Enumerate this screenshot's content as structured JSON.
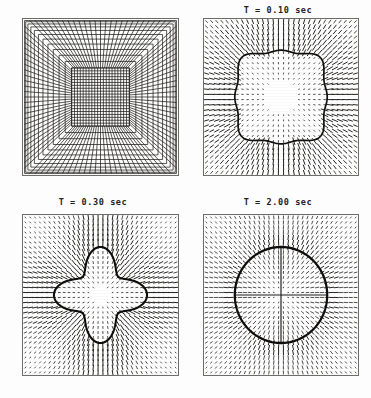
{
  "figure": {
    "title": "",
    "background_color": "#fdfdfd",
    "frame_color": "#6e6c68",
    "ink_color": "#1a1a1a",
    "panel_count": 4
  },
  "panels": [
    {
      "id": "panel-mesh-initial",
      "title": "",
      "kind": "mesh",
      "description": "undeformed graded square finite-element mesh"
    },
    {
      "id": "panel-t-010",
      "title": "T = 0.10 sec",
      "kind": "vector-field",
      "shape": "rounded-square-blob",
      "description": "deformed interface with outward radial velocity vectors"
    },
    {
      "id": "panel-t-030",
      "title": "T = 0.30 sec",
      "kind": "vector-field",
      "shape": "astroid-star",
      "description": "four-cusped concave star interface with radial velocity vectors"
    },
    {
      "id": "panel-t-200",
      "title": "T = 2.00 sec",
      "kind": "vector-field",
      "shape": "circle",
      "description": "relaxed circular interface with radial velocity vectors"
    }
  ],
  "chart_data": {
    "type": "scatter",
    "title": "",
    "xlabel": "",
    "ylabel": "",
    "grid": false,
    "legend": null,
    "subplots": [
      {
        "name": "panel-mesh-initial",
        "type": "mesh",
        "title": "",
        "row": 0,
        "col": 0,
        "xlim": [
          -1,
          1
        ],
        "ylim": [
          -1,
          1
        ],
        "mesh": {
          "style": "graded concentric square rings with radial corner lines",
          "ring_count": 11,
          "divisions_per_side": 28,
          "interior_uniform_grid": 20,
          "grading": "fine near outer boundary, uniform in core"
        }
      },
      {
        "name": "panel-t-010",
        "type": "vector-field",
        "title": "T = 0.10 sec",
        "time_value": 0.1,
        "time_units": "sec",
        "row": 0,
        "col": 1,
        "xlim": [
          -1,
          1
        ],
        "ylim": [
          -1,
          1
        ],
        "interface": {
          "shape": "rounded-square-blob",
          "mean_radius": 0.58,
          "lobe_count": 8,
          "lobe_amplitude": 0.035,
          "line_width": 2.2
        },
        "vectors": {
          "grid_nx": 30,
          "grid_ny": 30,
          "direction": "radial-outward",
          "inside_magnitude": 0.22,
          "outside_magnitude": 1.0,
          "max_len_px": 9
        }
      },
      {
        "name": "panel-t-030",
        "type": "vector-field",
        "title": "T = 0.30 sec",
        "time_value": 0.3,
        "time_units": "sec",
        "row": 1,
        "col": 0,
        "xlim": [
          -1,
          1
        ],
        "ylim": [
          -1,
          1
        ],
        "interface": {
          "shape": "astroid-star",
          "mean_radius": 0.52,
          "cusp_count": 4,
          "cusp_angles_deg": [
            0,
            90,
            180,
            270
          ],
          "concavity": 0.3,
          "line_width": 2.6
        },
        "vectors": {
          "grid_nx": 32,
          "grid_ny": 32,
          "direction": "radial-outward",
          "inside_magnitude": 0.3,
          "outside_magnitude": 1.0,
          "max_len_px": 9
        }
      },
      {
        "name": "panel-t-200",
        "type": "vector-field",
        "title": "T = 2.00 sec",
        "time_value": 2.0,
        "time_units": "sec",
        "row": 1,
        "col": 1,
        "xlim": [
          -1,
          1
        ],
        "ylim": [
          -1,
          1
        ],
        "interface": {
          "shape": "circle",
          "radius": 0.6,
          "line_width": 2.8
        },
        "vectors": {
          "grid_nx": 32,
          "grid_ny": 32,
          "direction": "radial-with-axis-cross",
          "inside_magnitude": 0.55,
          "outside_magnitude": 0.75,
          "max_len_px": 8,
          "axis_cross": true
        }
      }
    ]
  }
}
